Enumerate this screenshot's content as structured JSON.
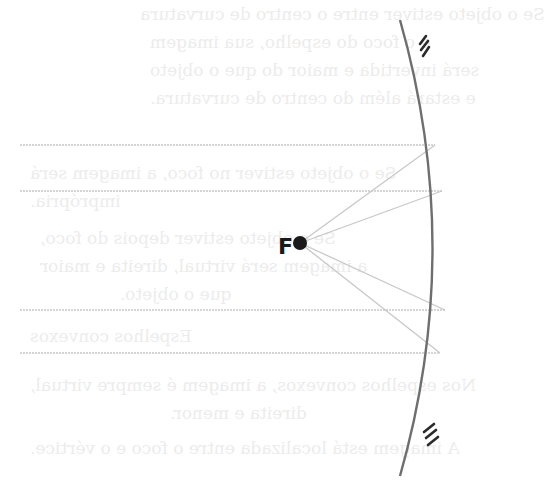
{
  "diagram": {
    "focus": {
      "label": "F",
      "x": 300,
      "y": 243,
      "radius": 7,
      "color": "#1a1a1a"
    },
    "mirror": {
      "type": "concave",
      "stroke": "#6e6e6e",
      "top": [
        400,
        20
      ],
      "control": [
        465,
        248
      ],
      "bottom": [
        400,
        476
      ],
      "hatch_top": "///",
      "hatch_bottom": "///"
    },
    "rays": [
      {
        "id": "ray-1",
        "start_x": 20,
        "y": 145,
        "hit_x": 435
      },
      {
        "id": "ray-2",
        "start_x": 20,
        "y": 191,
        "hit_x": 442
      },
      {
        "id": "ray-3",
        "start_x": 20,
        "y": 310,
        "hit_x": 445
      },
      {
        "id": "ray-4",
        "start_x": 20,
        "y": 353,
        "hit_x": 440
      }
    ],
    "ray_color": "#c8c8c8"
  },
  "bleed_through_text": [
    {
      "text": "Se o objeto estiver entre o centro de curvatura",
      "x": 140,
      "y": 4
    },
    {
      "text": "e o foco do espelho, sua imagem",
      "x": 150,
      "y": 32
    },
    {
      "text": "será invertida e maior do que o objeto",
      "x": 150,
      "y": 60
    },
    {
      "text": "e estará além do centro de curvatura.",
      "x": 150,
      "y": 88
    },
    {
      "text": "Se o objeto estiver no foco, a imagem será",
      "x": 30,
      "y": 163
    },
    {
      "text": "imprópria.",
      "x": 30,
      "y": 191
    },
    {
      "text": "Se o objeto estiver depois do foco,",
      "x": 40,
      "y": 228
    },
    {
      "text": "a imagem será virtual, direita e maior",
      "x": 40,
      "y": 256
    },
    {
      "text": "que o objeto.",
      "x": 120,
      "y": 284
    },
    {
      "text": "Espelhos convexos",
      "x": 30,
      "y": 326
    },
    {
      "text": "Nos espelhos convexos, a imagem é sempre virtual,",
      "x": 30,
      "y": 375
    },
    {
      "text": "direita e menor.",
      "x": 170,
      "y": 403
    },
    {
      "text": "A imagem está localizada entre o foco e o vértice.",
      "x": 30,
      "y": 438
    }
  ]
}
